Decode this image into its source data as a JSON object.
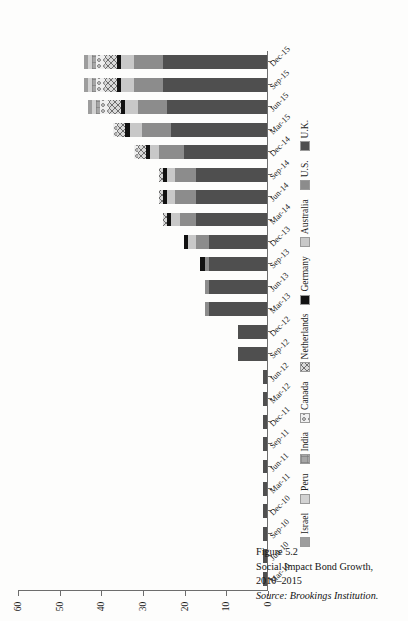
{
  "figure": {
    "number": "Figure 5.2",
    "title": "Social Impact Bond Growth, 2010–2015",
    "source": "Source: Brookings Institution."
  },
  "chart_data": {
    "type": "bar",
    "subtype": "stacked-horizontal-rotated",
    "title": "Social Impact Bond Growth, 2010–2015",
    "xlabel": "",
    "ylabel": "",
    "ylim": [
      0,
      60
    ],
    "yticks": [
      0,
      10,
      20,
      30,
      40,
      50,
      60
    ],
    "grid": false,
    "legend_position": "below-left",
    "orientation": "page rotated 90 degrees counter-clockwise",
    "categories": [
      "Mar-10",
      "Jun-10",
      "Sep-10",
      "Dec-10",
      "Mar-11",
      "Jun-11",
      "Sep-11",
      "Dec-11",
      "Mar-12",
      "Jun-12",
      "Sep-12",
      "Dec-12",
      "Mar-13",
      "Jun-13",
      "Sep-13",
      "Dec-13",
      "Mar-14",
      "Jun-14",
      "Sep-14",
      "Dec-14",
      "Mar-15",
      "Jun-15",
      "Sep-15",
      "Dec-15"
    ],
    "series": [
      {
        "name": "U.K.",
        "color": "#4f4f4f",
        "pattern": "solid",
        "values": [
          1,
          1,
          1,
          1,
          1,
          1,
          1,
          1,
          1,
          1,
          7,
          7,
          14,
          14,
          14,
          14,
          17,
          17,
          17,
          20,
          23,
          24,
          25,
          25
        ]
      },
      {
        "name": "U.S.",
        "color": "#8c8c8c",
        "pattern": "solid",
        "values": [
          0,
          0,
          0,
          0,
          0,
          0,
          0,
          0,
          0,
          0,
          0,
          0,
          1,
          1,
          1,
          3,
          4,
          5,
          5,
          6,
          7,
          7,
          7,
          7
        ]
      },
      {
        "name": "Australia",
        "color": "#c8c8c8",
        "pattern": "solid",
        "values": [
          0,
          0,
          0,
          0,
          0,
          0,
          0,
          0,
          0,
          0,
          0,
          0,
          0,
          0,
          0,
          2,
          2,
          2,
          2,
          2,
          3,
          3,
          3,
          3
        ]
      },
      {
        "name": "Germany",
        "color": "#111111",
        "pattern": "solid",
        "values": [
          0,
          0,
          0,
          0,
          0,
          0,
          0,
          0,
          0,
          0,
          0,
          0,
          0,
          0,
          1,
          1,
          1,
          1,
          1,
          1,
          1,
          1,
          1,
          1
        ]
      },
      {
        "name": "Netherlands",
        "color": "#d9d9d9",
        "pattern": "cross-hatch",
        "values": [
          0,
          0,
          0,
          0,
          0,
          0,
          0,
          0,
          0,
          0,
          0,
          0,
          0,
          0,
          0,
          0,
          1,
          1,
          1,
          2,
          2,
          3,
          3,
          3
        ]
      },
      {
        "name": "Canada",
        "color": "#f0f0f0",
        "pattern": "dot-hatch",
        "values": [
          0,
          0,
          0,
          0,
          0,
          0,
          0,
          0,
          0,
          0,
          0,
          0,
          0,
          0,
          0,
          0,
          0,
          0,
          0,
          1,
          1,
          2,
          2,
          2
        ]
      },
      {
        "name": "India",
        "color": "#a6a6a6",
        "pattern": "fine-grid",
        "values": [
          0,
          0,
          0,
          0,
          0,
          0,
          0,
          0,
          0,
          0,
          0,
          0,
          0,
          0,
          0,
          0,
          0,
          0,
          0,
          0,
          0,
          1,
          1,
          1
        ]
      },
      {
        "name": "Peru",
        "color": "#d2d2d2",
        "pattern": "solid",
        "values": [
          0,
          0,
          0,
          0,
          0,
          0,
          0,
          0,
          0,
          0,
          0,
          0,
          0,
          0,
          0,
          0,
          0,
          0,
          0,
          0,
          0,
          1,
          1,
          1
        ]
      },
      {
        "name": "Israel",
        "color": "#9d9d9d",
        "pattern": "solid",
        "values": [
          0,
          0,
          0,
          0,
          0,
          0,
          0,
          0,
          0,
          0,
          0,
          0,
          0,
          0,
          0,
          0,
          0,
          0,
          0,
          0,
          0,
          1,
          1,
          1
        ]
      }
    ],
    "legend_order_displayed": [
      "Israel",
      "Peru",
      "India",
      "Canada",
      "Netherlands",
      "Germany",
      "Australia",
      "U.S.",
      "U.K."
    ]
  },
  "axis": {
    "value_tick_labels": [
      "60",
      "50",
      "40",
      "30",
      "20",
      "10",
      "0"
    ],
    "category_tick_labels": [
      "Mar-10",
      "Jun-10",
      "Sep-10",
      "Dec-10",
      "Mar-11",
      "Jun-11",
      "Sep-11",
      "Dec-11",
      "Mar-12",
      "Jun-12",
      "Sep-12",
      "Dec-12",
      "Mar-13",
      "Jun-13",
      "Sep-13",
      "Dec-13",
      "Mar-14",
      "Jun-14",
      "Sep-14",
      "Dec-14",
      "Mar-15",
      "Jun-15",
      "Sep-15",
      "Dec-15"
    ]
  },
  "colors": {
    "axis": "#6d6d6d",
    "text": "#141414",
    "page": "#fdfdfc"
  }
}
